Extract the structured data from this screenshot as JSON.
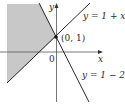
{
  "figure": {
    "axes": {
      "x_label": "x",
      "y_label": "y",
      "origin_label": "0"
    },
    "lines": [
      {
        "label": "y = 1 + x",
        "equation": "y = 1 + x"
      },
      {
        "label": "y = 1 − 2x",
        "equation": "y = 1 - 2x"
      }
    ],
    "intersection": {
      "label": "(0, 1)",
      "x": 0,
      "y": 1
    },
    "shaded_region": "region above y = 1 + x and left of y = 1 - 2x",
    "colors": {
      "shade": "#c8c8c8",
      "lines": "#2a2a2a",
      "axes": "#555555"
    }
  }
}
